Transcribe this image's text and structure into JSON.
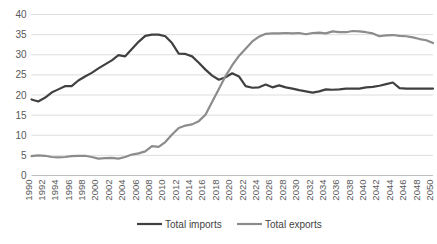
{
  "chart_data": {
    "type": "line",
    "title": "",
    "xlabel": "",
    "ylabel": "",
    "ylim": [
      0,
      40
    ],
    "ytick_step": 5,
    "ytick_labels": [
      "0",
      "5",
      "10",
      "15",
      "20",
      "25",
      "30",
      "35",
      "40"
    ],
    "xlim": [
      1990,
      2050
    ],
    "xtick_step": 2,
    "grid": "horizontal",
    "legend_position": "bottom",
    "x": [
      1990,
      1991,
      1992,
      1993,
      1994,
      1995,
      1996,
      1997,
      1998,
      1999,
      2000,
      2001,
      2002,
      2003,
      2004,
      2005,
      2006,
      2007,
      2008,
      2009,
      2010,
      2011,
      2012,
      2013,
      2014,
      2015,
      2016,
      2017,
      2018,
      2019,
      2020,
      2021,
      2022,
      2023,
      2024,
      2025,
      2026,
      2027,
      2028,
      2029,
      2030,
      2031,
      2032,
      2033,
      2034,
      2035,
      2036,
      2037,
      2038,
      2039,
      2040,
      2041,
      2042,
      2043,
      2044,
      2045,
      2046,
      2047,
      2048,
      2049,
      2050
    ],
    "xtick_labels": [
      "1990",
      "1992",
      "1994",
      "1996",
      "1998",
      "2000",
      "2002",
      "2004",
      "2006",
      "2008",
      "2010",
      "2012",
      "2014",
      "2016",
      "2018",
      "2020",
      "2022",
      "2024",
      "2026",
      "2028",
      "2030",
      "2032",
      "2034",
      "2036",
      "2038",
      "2040",
      "2042",
      "2044",
      "2046",
      "2048",
      "2050"
    ],
    "series": [
      {
        "name": "Total imports",
        "color": "#404040",
        "width": 2.2,
        "values": [
          18.9,
          18.4,
          19.3,
          20.6,
          21.4,
          22.2,
          22.2,
          23.6,
          24.6,
          25.5,
          26.6,
          27.6,
          28.6,
          29.9,
          29.6,
          31.4,
          33.2,
          34.7,
          35.0,
          35.0,
          34.6,
          32.9,
          30.3,
          30.2,
          29.6,
          28.0,
          26.3,
          24.8,
          23.8,
          24.4,
          25.4,
          24.6,
          22.2,
          21.8,
          21.9,
          22.6,
          21.9,
          22.4,
          21.9,
          21.6,
          21.2,
          20.9,
          20.6,
          20.9,
          21.4,
          21.3,
          21.4,
          21.6,
          21.6,
          21.6,
          21.9,
          22.0,
          22.3,
          22.7,
          23.1,
          21.7,
          21.6,
          21.6,
          21.6,
          21.6,
          21.6
        ]
      },
      {
        "name": "Total exports",
        "color": "#8c8c8c",
        "width": 2.2,
        "values": [
          4.8,
          5.0,
          4.9,
          4.6,
          4.5,
          4.6,
          4.8,
          4.9,
          4.9,
          4.6,
          4.2,
          4.3,
          4.4,
          4.2,
          4.6,
          5.2,
          5.5,
          6.0,
          7.3,
          7.1,
          8.3,
          10.2,
          11.8,
          12.4,
          12.7,
          13.5,
          15.1,
          18.3,
          21.5,
          24.7,
          27.4,
          29.7,
          31.5,
          33.3,
          34.5,
          35.2,
          35.3,
          35.3,
          35.4,
          35.3,
          35.4,
          35.1,
          35.4,
          35.5,
          35.3,
          35.8,
          35.6,
          35.6,
          35.9,
          35.8,
          35.6,
          35.3,
          34.6,
          34.8,
          34.9,
          34.7,
          34.6,
          34.3,
          33.9,
          33.6,
          32.9
        ]
      }
    ]
  },
  "legend": {
    "items": [
      {
        "label": "Total imports"
      },
      {
        "label": "Total exports"
      }
    ]
  },
  "caption": {
    "text": ""
  }
}
